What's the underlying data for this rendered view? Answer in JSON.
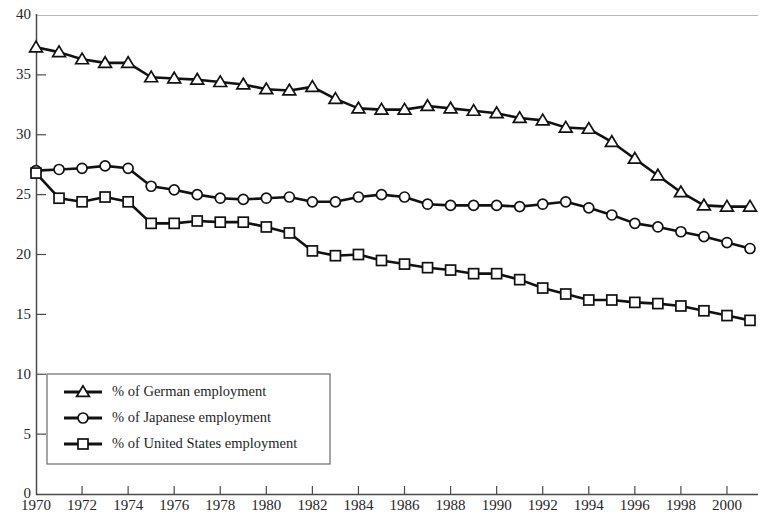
{
  "chart_data": {
    "type": "line",
    "title": "",
    "subtitle": "",
    "xlabel": "",
    "ylabel": "",
    "xlim": [
      1970,
      2001
    ],
    "ylim": [
      0,
      40
    ],
    "grid": false,
    "legend_position": "lower-left",
    "y_ticks": [
      0,
      5,
      10,
      15,
      20,
      25,
      30,
      35,
      40
    ],
    "y_tick_labels": [
      "0",
      "5",
      "10",
      "15",
      "20",
      "25",
      "30",
      "35",
      "40"
    ],
    "x_ticks": [
      1970,
      1972,
      1974,
      1976,
      1978,
      1980,
      1982,
      1984,
      1986,
      1988,
      1990,
      1992,
      1994,
      1996,
      1998,
      2000
    ],
    "x_tick_labels": [
      "1970",
      "1972",
      "1974",
      "1976",
      "1978",
      "1980",
      "1982",
      "1984",
      "1986",
      "1988",
      "1990",
      "1992",
      "1994",
      "1996",
      "1998",
      "2000"
    ],
    "x": [
      1970,
      1971,
      1972,
      1973,
      1974,
      1975,
      1976,
      1977,
      1978,
      1979,
      1980,
      1981,
      1982,
      1983,
      1984,
      1985,
      1986,
      1987,
      1988,
      1989,
      1990,
      1991,
      1992,
      1993,
      1994,
      1995,
      1996,
      1997,
      1998,
      1999,
      2000,
      2001
    ],
    "series": [
      {
        "name": "% of German employment",
        "marker": "triangle",
        "color": "#111111",
        "values": [
          37.3,
          36.9,
          36.3,
          36.0,
          36.0,
          34.8,
          34.7,
          34.6,
          34.4,
          34.2,
          33.8,
          33.7,
          34.0,
          33.0,
          32.2,
          32.1,
          32.1,
          32.4,
          32.2,
          32.0,
          31.8,
          31.4,
          31.2,
          30.6,
          30.5,
          29.4,
          28.0,
          26.6,
          25.2,
          24.1,
          24.0,
          24.0
        ]
      },
      {
        "name": "% of Japanese employment",
        "marker": "circle",
        "color": "#111111",
        "values": [
          27.0,
          27.1,
          27.2,
          27.4,
          27.2,
          25.7,
          25.4,
          25.0,
          24.7,
          24.6,
          24.7,
          24.8,
          24.4,
          24.4,
          24.8,
          25.0,
          24.8,
          24.2,
          24.1,
          24.1,
          24.1,
          24.0,
          24.2,
          24.4,
          23.9,
          23.3,
          22.6,
          22.3,
          21.9,
          21.5,
          21.0,
          20.5
        ]
      },
      {
        "name": "% of United States employment",
        "marker": "square",
        "color": "#111111",
        "values": [
          26.8,
          24.7,
          24.4,
          24.8,
          24.4,
          22.6,
          22.6,
          22.8,
          22.7,
          22.7,
          22.3,
          21.8,
          20.3,
          19.9,
          20.0,
          19.5,
          19.2,
          18.9,
          18.7,
          18.4,
          18.4,
          17.9,
          17.2,
          16.7,
          16.2,
          16.2,
          16.0,
          15.9,
          15.7,
          15.3,
          14.9,
          14.5
        ]
      }
    ]
  },
  "legend": {
    "items": [
      {
        "label": "% of German employment",
        "marker": "triangle"
      },
      {
        "label": "% of Japanese employment",
        "marker": "circle"
      },
      {
        "label": "% of United States employment",
        "marker": "square"
      }
    ]
  },
  "colors": {
    "line": "#111111",
    "marker_fill": "#ffffff",
    "axis": "#4a4a4a",
    "text": "#262626",
    "background": "#ffffff"
  }
}
